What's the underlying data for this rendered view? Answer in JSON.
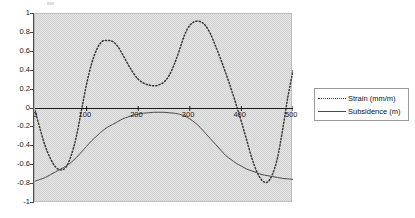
{
  "chart_data": {
    "type": "line",
    "title": "",
    "xlabel": "",
    "ylabel": "",
    "xlim": [
      0,
      500
    ],
    "ylim": [
      -1,
      1
    ],
    "grid": false,
    "background": "#e4e4e4",
    "legend_position": "right",
    "x_ticks": [
      "0",
      "100",
      "200",
      "300",
      "400",
      "500"
    ],
    "x_tick_values": [
      0,
      100,
      200,
      300,
      400,
      500
    ],
    "y_ticks": [
      "1",
      "0.8",
      "0.6",
      "0.4",
      "0.2",
      "0",
      "-0.2",
      "-0.4",
      "-0.6",
      "-0.8",
      "-1"
    ],
    "y_tick_values": [
      1,
      0.8,
      0.6,
      0.4,
      0.2,
      0,
      -0.2,
      -0.4,
      -0.6,
      -0.8,
      -1
    ],
    "series": [
      {
        "name": "Strain (mm/m)",
        "style": "dotted",
        "color": "#3a3a3a",
        "x": [
          0,
          10,
          20,
          30,
          40,
          50,
          60,
          70,
          80,
          90,
          100,
          110,
          120,
          130,
          140,
          150,
          160,
          170,
          180,
          190,
          200,
          210,
          220,
          230,
          240,
          250,
          260,
          270,
          280,
          290,
          300,
          310,
          320,
          330,
          340,
          350,
          360,
          370,
          380,
          390,
          400,
          410,
          420,
          430,
          440,
          450,
          460,
          470,
          480,
          490,
          500
        ],
        "y": [
          -0.02,
          -0.22,
          -0.4,
          -0.53,
          -0.62,
          -0.65,
          -0.62,
          -0.5,
          -0.3,
          -0.02,
          0.26,
          0.48,
          0.63,
          0.71,
          0.72,
          0.71,
          0.66,
          0.57,
          0.47,
          0.38,
          0.31,
          0.27,
          0.25,
          0.24,
          0.25,
          0.28,
          0.35,
          0.47,
          0.62,
          0.78,
          0.88,
          0.92,
          0.92,
          0.88,
          0.79,
          0.66,
          0.52,
          0.37,
          0.21,
          0.04,
          -0.14,
          -0.33,
          -0.52,
          -0.67,
          -0.76,
          -0.78,
          -0.7,
          -0.52,
          -0.22,
          0.12,
          0.4
        ]
      },
      {
        "name": "Subsidence (m)",
        "style": "solid",
        "color": "#4a4a4a",
        "x": [
          0,
          10,
          20,
          30,
          40,
          50,
          60,
          70,
          80,
          90,
          100,
          110,
          120,
          130,
          140,
          150,
          160,
          170,
          180,
          190,
          200,
          210,
          220,
          230,
          240,
          250,
          260,
          270,
          280,
          290,
          300,
          310,
          320,
          330,
          340,
          350,
          360,
          370,
          380,
          390,
          400,
          410,
          420,
          430,
          440,
          450,
          460,
          470,
          480,
          490,
          500
        ],
        "y": [
          -0.77,
          -0.75,
          -0.73,
          -0.7,
          -0.67,
          -0.64,
          -0.61,
          -0.57,
          -0.52,
          -0.46,
          -0.4,
          -0.34,
          -0.29,
          -0.24,
          -0.2,
          -0.17,
          -0.14,
          -0.11,
          -0.09,
          -0.07,
          -0.06,
          -0.05,
          -0.045,
          -0.04,
          -0.04,
          -0.04,
          -0.045,
          -0.05,
          -0.06,
          -0.08,
          -0.11,
          -0.15,
          -0.2,
          -0.26,
          -0.32,
          -0.38,
          -0.44,
          -0.5,
          -0.54,
          -0.58,
          -0.61,
          -0.64,
          -0.66,
          -0.68,
          -0.7,
          -0.71,
          -0.72,
          -0.73,
          -0.74,
          -0.745,
          -0.75
        ]
      }
    ]
  },
  "legend": {
    "items": [
      {
        "label": "Strain (mm/m)",
        "style": "dotted"
      },
      {
        "label": "Subsidence (m)",
        "style": "solid"
      }
    ]
  }
}
